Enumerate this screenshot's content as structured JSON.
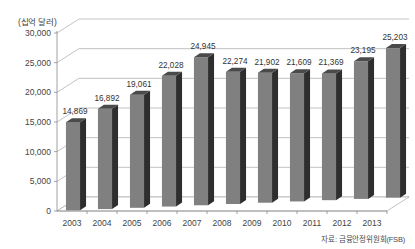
{
  "chart_data": {
    "type": "bar",
    "title": "",
    "subtitle": "",
    "xlabel": "",
    "ylabel": "(십억 달러)",
    "unit_label": "(십억 달러)",
    "categories": [
      "2003",
      "2004",
      "2005",
      "2006",
      "2007",
      "2008",
      "2009",
      "2010",
      "2011",
      "2012",
      "2013"
    ],
    "values": [
      14869,
      16892,
      19061,
      22028,
      24945,
      22274,
      21902,
      21609,
      21369,
      23195,
      25203
    ],
    "value_labels": [
      "14,869",
      "16,892",
      "19,061",
      "22,028",
      "24,945",
      "22,274",
      "21,902",
      "21,609",
      "21,369",
      "23,195",
      "25,203"
    ],
    "ylim": [
      0,
      30000
    ],
    "ytick_values": [
      0,
      5000,
      10000,
      15000,
      20000,
      25000,
      30000
    ],
    "ytick_labels": [
      "0",
      "5,000",
      "10,000",
      "15,000",
      "20,000",
      "25,000",
      "30,000"
    ],
    "grid": true,
    "legend": false,
    "legend_position": "none",
    "series": [
      {
        "name": "",
        "values": [
          14869,
          16892,
          19061,
          22028,
          24945,
          22274,
          21902,
          21609,
          21369,
          23195,
          25203
        ]
      }
    ],
    "style": "3d-column",
    "colors": {
      "bar_front": "#808080",
      "bar_side": "#2e2e2e",
      "bar_top": "#4a4a4a",
      "gridline": "#9a9a9a",
      "axis": "#8a8a8a",
      "text": "#444444",
      "background": "#ffffff"
    }
  },
  "source": {
    "note": "자료: 금융안정위원회(FSB)"
  }
}
